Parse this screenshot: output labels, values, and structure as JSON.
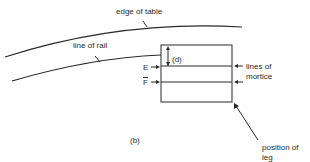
{
  "figure": {
    "panel_label": "(b)",
    "labels": {
      "edge_of_table": "edge of table",
      "line_of_rail": "line of rail",
      "dimension": "(d)",
      "point_e": "E",
      "point_f": "F",
      "lines_of_mortice_1": "lines of",
      "lines_of_mortice_2": "mortice",
      "position_of_leg_1": "position of",
      "position_of_leg_2": "leg"
    },
    "colors": {
      "ink": "#2a2a2a",
      "background": "#ffffff"
    }
  }
}
